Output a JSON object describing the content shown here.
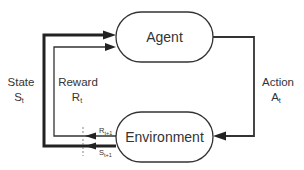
{
  "nodes": {
    "agent": {
      "label": "Agent"
    },
    "environment": {
      "label": "Environment"
    }
  },
  "edges": {
    "action": {
      "label": "Action",
      "symbol": "A",
      "subscript": "t"
    },
    "state": {
      "label": "State",
      "symbol": "S",
      "subscript": "t"
    },
    "reward": {
      "label": "Reward",
      "symbol": "R",
      "subscript": "t"
    },
    "next_reward": {
      "symbol": "R",
      "subscript": "t+1"
    },
    "next_state": {
      "symbol": "S",
      "subscript": "t+1"
    }
  },
  "colors": {
    "stroke": "#333333",
    "text": "#333333",
    "background": "#ffffff"
  }
}
